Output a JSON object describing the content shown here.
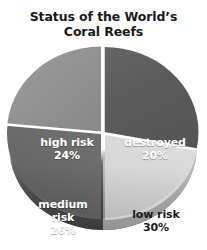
{
  "chart_data": {
    "type": "pie",
    "title_lines": [
      "Status of the World’s",
      "Coral Reefs"
    ],
    "categories": [
      "destroyed",
      "low risk",
      "medium risk",
      "high risk"
    ],
    "values": [
      20,
      30,
      26,
      24
    ],
    "value_labels": [
      "20%",
      "30%",
      "26%",
      "24%"
    ],
    "unit": "%",
    "legend": "none",
    "grid": false,
    "three_d": true,
    "slices": [
      {
        "name": "destroyed",
        "label_lines": [
          "destroyed"
        ],
        "value": 20,
        "value_label": "20%",
        "color": "#585858",
        "text_color": "#ffffff",
        "position": "upper-right"
      },
      {
        "name": "low risk",
        "label_lines": [
          "low risk"
        ],
        "value": 30,
        "value_label": "30%",
        "color": "#dcdcdc",
        "text_color": "#1a1a1a",
        "position": "lower-right"
      },
      {
        "name": "medium risk",
        "label_lines": [
          "medium",
          "risk"
        ],
        "value": 26,
        "value_label": "26%",
        "color": "#707070",
        "text_color": "#ffffff",
        "position": "lower-left"
      },
      {
        "name": "high risk",
        "label_lines": [
          "high risk"
        ],
        "value": 24,
        "value_label": "24%",
        "color": "#888888",
        "text_color": "#ffffff",
        "position": "upper-left"
      }
    ]
  },
  "title": {
    "line1": "Status of the World’s",
    "line2": "Coral Reefs"
  },
  "labels": {
    "destroyed": {
      "name": "destroyed",
      "value": "20%"
    },
    "low_risk": {
      "name": "low risk",
      "value": "30%"
    },
    "medium_risk": {
      "name_line1": "medium",
      "name_line2": "risk",
      "value": "26%"
    },
    "high_risk": {
      "name": "high risk",
      "value": "24%"
    }
  }
}
